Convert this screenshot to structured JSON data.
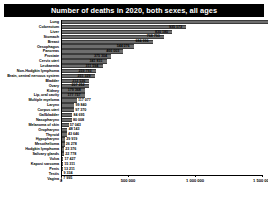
{
  "chart": {
    "title": "Number of deaths in 2020, both sexes, all ages"
  },
  "axis": {
    "ticks": [
      "0",
      "500 000",
      "1 000 000",
      "1 500 000"
    ]
  },
  "chart_data": {
    "type": "bar",
    "orientation": "horizontal",
    "title": "Number of deaths in 2020, both sexes, all ages",
    "xlabel": "",
    "ylabel": "",
    "xlim": [
      0,
      1800000
    ],
    "grid": false,
    "legend": null,
    "categories": [
      "Lung",
      "Colorectum",
      "Liver",
      "Stomach",
      "Breast",
      "Oesophagus",
      "Pancreas",
      "Prostate",
      "Cervix uteri",
      "Leukaemia",
      "Non-Hodgkin lymphoma",
      "Brain, central nervous system",
      "Bladder",
      "Ovary",
      "Kidney",
      "Lip, oral cavity",
      "Multiple myeloma",
      "Larynx",
      "Corpus uteri",
      "Gallbladder",
      "Nasopharynx",
      "Melanoma of skin",
      "Oropharynx",
      "Thyroid",
      "Hypopharynx",
      "Mesothelioma",
      "Hodgkin lymphoma",
      "Salivary glands",
      "Vulva",
      "Kaposi sarcoma",
      "Penis",
      "Testis",
      "Vagina"
    ],
    "values": [
      1796144,
      935173,
      830180,
      768793,
      684996,
      544076,
      466003,
      375304,
      341831,
      311594,
      259793,
      251329,
      212536,
      207252,
      179368,
      177757,
      117077,
      99840,
      97370,
      84695,
      80008,
      57043,
      48143,
      43646,
      29919,
      26278,
      23376,
      22778,
      17427,
      15311,
      13211,
      9334,
      7995
    ],
    "value_labels": [
      "1 796 144",
      "935 173",
      "830 180",
      "768 793",
      "684 996",
      "544 076",
      "466 003",
      "375 304",
      "341 831",
      "311 594",
      "259 793",
      "251 329",
      "212 536",
      "207 252",
      "179 368",
      "177 757",
      "117 077",
      "99 840",
      "97 370",
      "84 695",
      "80 008",
      "57 043",
      "48 143",
      "43 646",
      "29 919",
      "26 278",
      "23 376",
      "22 778",
      "17 427",
      "15 311",
      "13 211",
      "9 334",
      "7 995"
    ],
    "xticks": [
      0,
      500000,
      1000000,
      1500000
    ],
    "xtick_labels": [
      "0",
      "500 000",
      "1 000 000",
      "1 500 000"
    ],
    "bar_color": "#6e6e6e"
  }
}
